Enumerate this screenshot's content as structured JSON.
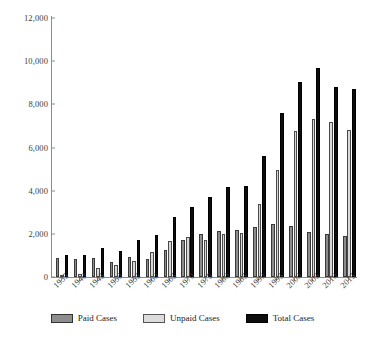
{
  "chart_data": {
    "type": "bar",
    "title": "",
    "subtitle": "",
    "xlabel": "",
    "ylabel": "",
    "ylim": [
      0,
      12000
    ],
    "ytick_values": [
      0,
      2000,
      4000,
      6000,
      8000,
      10000,
      12000
    ],
    "ytick_labels": [
      "0",
      "2,000",
      "4,000",
      "6,000",
      "8,000",
      "10,000",
      "12,000"
    ],
    "grid": false,
    "legend_position": "bottom",
    "categories": [
      "1935",
      "1940",
      "1945",
      "1950",
      "1955",
      "1960",
      "1965",
      "1970",
      "1975",
      "1980",
      "1985",
      "1990",
      "1995",
      "2000",
      "2005",
      "2010",
      "2015"
    ],
    "series": [
      {
        "name": "Paid Cases",
        "color": "#8d8d8d",
        "values": [
          900,
          850,
          900,
          700,
          950,
          850,
          1250,
          1700,
          2000,
          2150,
          2200,
          2300,
          2450,
          2350,
          2100,
          2000,
          1900
        ]
      },
      {
        "name": "Unpaid Cases",
        "color": "#d9d9d9",
        "values": [
          100,
          150,
          400,
          550,
          750,
          1150,
          1650,
          1850,
          1700,
          2000,
          2050,
          3400,
          4950,
          6750,
          7300,
          7200,
          6800
        ]
      },
      {
        "name": "Total Cases",
        "color": "#0d0d0d",
        "values": [
          1000,
          1000,
          1350,
          1200,
          1700,
          1950,
          2800,
          3250,
          3700,
          4150,
          4200,
          5600,
          7600,
          9050,
          9700,
          8800,
          8700
        ]
      }
    ]
  },
  "legend": {
    "items": [
      {
        "label": "Paid Cases",
        "key": "paid"
      },
      {
        "label": "Unpaid Cases",
        "key": "unpaid"
      },
      {
        "label": "Total Cases",
        "key": "total"
      }
    ]
  }
}
